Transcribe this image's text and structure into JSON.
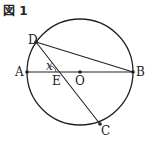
{
  "figure": {
    "title": "図 1",
    "labels": {
      "A": "A",
      "B": "B",
      "C": "C",
      "D": "D",
      "E": "E",
      "O": "O",
      "x": "x"
    },
    "colors": {
      "stroke": "#222222",
      "background": "#ffffff"
    }
  }
}
